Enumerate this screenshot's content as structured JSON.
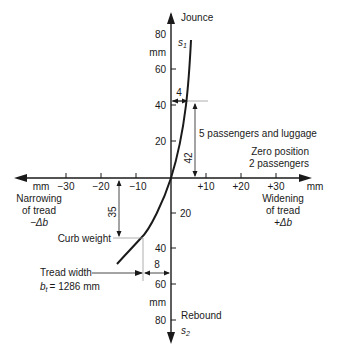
{
  "diagram": {
    "vertical_axis": {
      "top_label": "Jounce",
      "bottom_label": "Rebound",
      "top_symbol": "s",
      "top_symbol_sub": "1",
      "bottom_symbol": "s",
      "bottom_symbol_sub": "2",
      "unit": "mm",
      "ticks_up": [
        "80",
        "60",
        "40",
        "20"
      ],
      "ticks_down": [
        "20",
        "40",
        "60",
        "80"
      ]
    },
    "horizontal_axis": {
      "unit_left": "mm",
      "unit_right": "mm",
      "ticks_left": [
        "−30",
        "−20",
        "−10"
      ],
      "ticks_right": [
        "+10",
        "+20",
        "+30"
      ],
      "left_label": [
        "Narrowing",
        "of tread",
        "−Δb"
      ],
      "right_label": [
        "Widening",
        "of tread",
        "+Δb"
      ]
    },
    "annotations": {
      "dim_4": "4",
      "dim_42": "42",
      "dim_35": "35",
      "dim_8": "8",
      "five_passengers": "5 passengers and luggage",
      "zero_position": [
        "Zero position",
        "2 passengers"
      ],
      "curb_weight": "Curb weight",
      "tread_width": [
        "Tread width",
        "= 1286 mm"
      ],
      "tread_symbol": "b",
      "tread_symbol_sub": "t"
    }
  }
}
